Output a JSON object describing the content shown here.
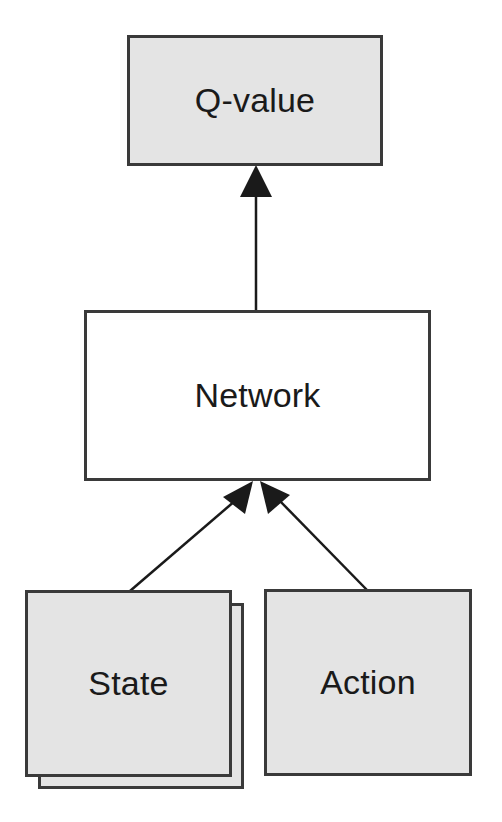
{
  "diagram": {
    "type": "flow",
    "direction": "bottom-to-top",
    "colors": {
      "node_fill_gray": "#e4e4e4",
      "node_fill_white": "#ffffff",
      "border": "#3a3a3a",
      "arrow": "#1a1a1a",
      "text": "#1a1a1a"
    },
    "nodes": {
      "qvalue": {
        "label": "Q-value",
        "fill": "gray"
      },
      "network": {
        "label": "Network",
        "fill": "white"
      },
      "state": {
        "label": "State",
        "fill": "gray",
        "stacked": true
      },
      "action": {
        "label": "Action",
        "fill": "gray"
      }
    },
    "edges": [
      {
        "from": "network",
        "to": "qvalue"
      },
      {
        "from": "state",
        "to": "network"
      },
      {
        "from": "action",
        "to": "network"
      }
    ]
  }
}
